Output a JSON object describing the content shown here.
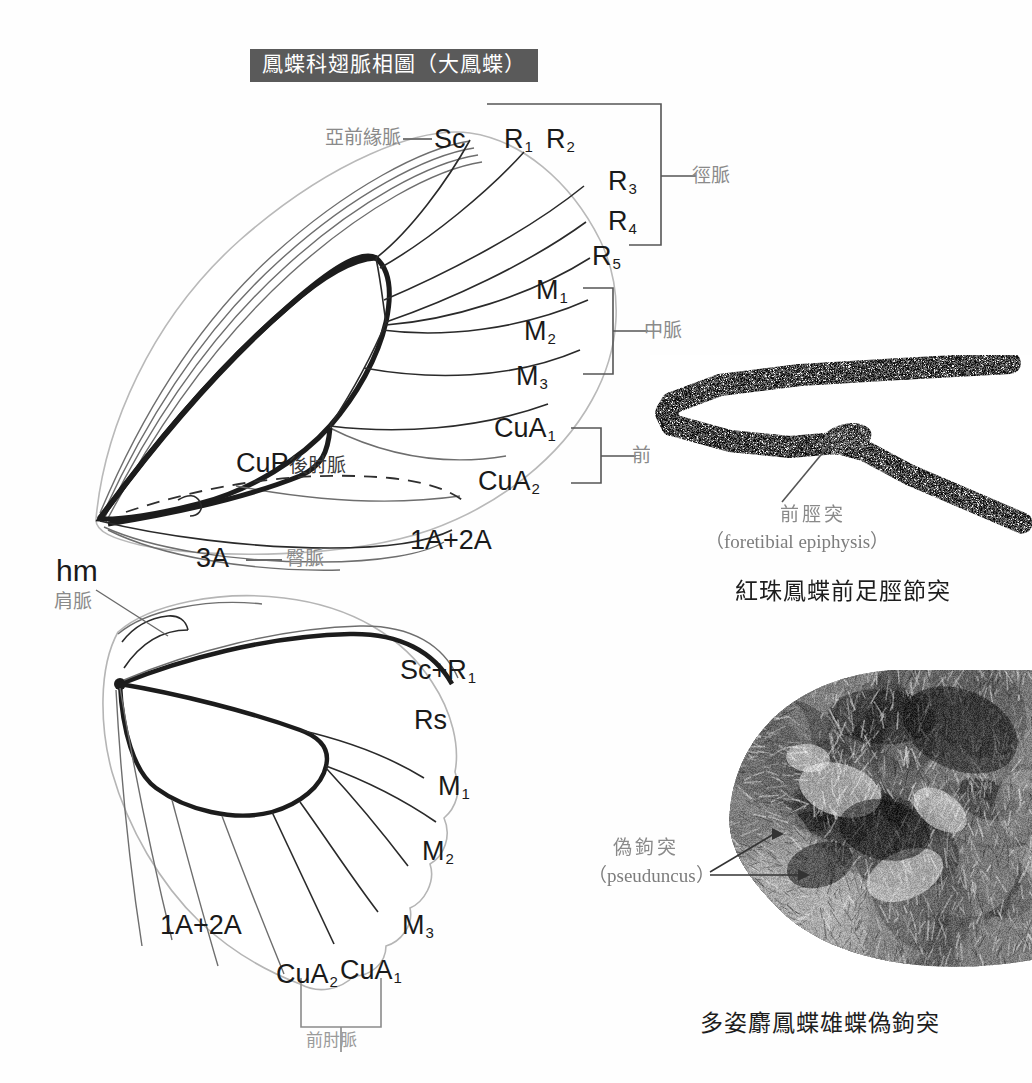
{
  "page": {
    "background": "#fefefe",
    "title": "鳳蝶科翅脈相圖（大鳳蝶）",
    "title_bg": "#5a5a5a",
    "title_color": "#ffffff"
  },
  "forewing": {
    "name": "forewing-venation-diagram",
    "labels": {
      "subcostal_cn": "亞前緣脈",
      "subcostal_dash": "—",
      "subcostal": "Sc",
      "r1": "R",
      "r1_sub": "1",
      "r2": "R",
      "r2_sub": "2",
      "r3": "R",
      "r3_sub": "3",
      "r4": "R",
      "r4_sub": "4",
      "r5": "R",
      "r5_sub": "5",
      "m1": "M",
      "m1_sub": "1",
      "m2": "M",
      "m2_sub": "2",
      "m3": "M",
      "m3_sub": "3",
      "cua1": "CuA",
      "cua1_sub": "1",
      "cua2": "CuA",
      "cua2_sub": "2",
      "cup": "CuP",
      "cup_cn": "後肘脈",
      "a3": "3A",
      "a3_dash": "—",
      "a3_cn": "臀脈",
      "a12": "1A+2A"
    },
    "brackets": {
      "radial_cn": "徑脈",
      "medial_cn": "中脈",
      "cubital_cn": "前肘脈"
    }
  },
  "hindwing": {
    "name": "hindwing-venation-diagram",
    "labels": {
      "hm": "hm",
      "hm_cn": "肩脈",
      "sc_r1": "Sc+R",
      "sc_r1_sub": "1",
      "rs": "Rs",
      "m1": "M",
      "m1_sub": "1",
      "m2": "M",
      "m2_sub": "2",
      "m3": "M",
      "m3_sub": "3",
      "cua1": "CuA",
      "cua1_sub": "1",
      "cua2": "CuA",
      "cua2_sub": "2",
      "a12": "1A+2A"
    },
    "brackets": {
      "cubital_cn": "前肘脈"
    }
  },
  "photo_top": {
    "name": "foretibia-photograph",
    "callout_cn": "前脛突",
    "callout_sci": "（foretibial epiphysis）",
    "caption": "紅珠鳳蝶前足脛節突"
  },
  "photo_bottom": {
    "name": "genitalia-photograph",
    "callout_cn": "偽鉤突",
    "callout_sci": "（pseuduncus）",
    "caption": "多姿麝鳳蝶雄蝶偽鉤突"
  }
}
